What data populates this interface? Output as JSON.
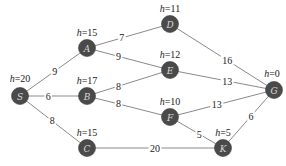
{
  "diagram": {
    "type": "weighted-graph",
    "nodes": [
      {
        "id": "S",
        "h": "h=20",
        "x": 20,
        "y": 96
      },
      {
        "id": "A",
        "h": "h=15",
        "x": 87,
        "y": 48
      },
      {
        "id": "B",
        "h": "h=17",
        "x": 87,
        "y": 96
      },
      {
        "id": "C",
        "h": "h=15",
        "x": 87,
        "y": 148
      },
      {
        "id": "D",
        "h": "h=11",
        "x": 170,
        "y": 24
      },
      {
        "id": "E",
        "h": "h=12",
        "x": 170,
        "y": 70
      },
      {
        "id": "F",
        "h": "h=10",
        "x": 170,
        "y": 117
      },
      {
        "id": "K",
        "h": "h=5",
        "x": 223,
        "y": 148
      },
      {
        "id": "G",
        "h": "h=0",
        "x": 274,
        "y": 90
      }
    ],
    "edges": [
      {
        "from": "S",
        "to": "A",
        "weight": "9"
      },
      {
        "from": "S",
        "to": "B",
        "weight": "6"
      },
      {
        "from": "S",
        "to": "C",
        "weight": "8"
      },
      {
        "from": "A",
        "to": "D",
        "weight": "7"
      },
      {
        "from": "A",
        "to": "E",
        "weight": "9"
      },
      {
        "from": "B",
        "to": "E",
        "weight": "8"
      },
      {
        "from": "B",
        "to": "F",
        "weight": "8"
      },
      {
        "from": "D",
        "to": "G",
        "weight": "16"
      },
      {
        "from": "E",
        "to": "G",
        "weight": "13"
      },
      {
        "from": "F",
        "to": "G",
        "weight": "13"
      },
      {
        "from": "F",
        "to": "K",
        "weight": "5"
      },
      {
        "from": "C",
        "to": "K",
        "weight": "20"
      },
      {
        "from": "K",
        "to": "G",
        "weight": "6"
      }
    ]
  },
  "colors": {
    "node_fill": "#4a4a4a",
    "node_text": "#d8d8d8",
    "edge": "#8a8a8a",
    "text": "#222222"
  }
}
